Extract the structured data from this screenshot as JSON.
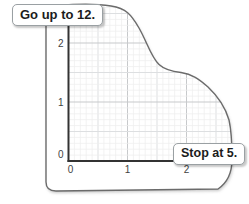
{
  "figure": {
    "callouts": {
      "go_up": "Go up to 12.",
      "stop": "Stop at 5."
    }
  },
  "chart_data": {
    "type": "area",
    "title": "",
    "xlabel": "",
    "ylabel": "",
    "x_ticks": [
      "0",
      "1",
      "2"
    ],
    "y_ticks": [
      "0",
      "1",
      "2"
    ],
    "xlim": [
      0,
      2.9
    ],
    "ylim": [
      0,
      2.7
    ],
    "grid": true,
    "minor_grid_step": 0.1,
    "medium_grid_step": 0.5,
    "major_grid_step": 1.0,
    "annotations": [
      "Go up to 12.",
      "Stop at 5."
    ],
    "region_boundary_points": [
      [
        0.0,
        2.65
      ],
      [
        0.4,
        2.66
      ],
      [
        0.72,
        2.63
      ],
      [
        1.0,
        2.45
      ],
      [
        1.2,
        2.25
      ],
      [
        1.35,
        1.95
      ],
      [
        1.53,
        1.63
      ],
      [
        1.7,
        1.52
      ],
      [
        1.9,
        1.5
      ],
      [
        2.1,
        1.38
      ],
      [
        2.36,
        1.11
      ],
      [
        2.57,
        0.78
      ],
      [
        2.72,
        0.43
      ],
      [
        2.77,
        0.18
      ],
      [
        2.77,
        0.0
      ]
    ],
    "region_path_px": "M 46,16 C 46,9 50,5.5 58,5.5 C 76,4 96,3.5 111,6 C 126,8.5 131,14 139,28 C 147,42 151,57 159,64.5 C 165,70 172,71.5 181,72.5 C 192,74 199,79 208,87 C 217,95.5 225,106 229,120 C 231.5,131 232,146 232,159.5 C 232,171 229,181.5 218,189 L 56,191 C 49,191 46,188 46,182 Z",
    "colors": {
      "outline": "#6b6b6b",
      "axis": "#333333",
      "grid_major": "#c7c9cb",
      "grid_medium": "#dddfe1",
      "grid_minor": "#ededee",
      "tick_text": "#3f3f3f"
    }
  }
}
